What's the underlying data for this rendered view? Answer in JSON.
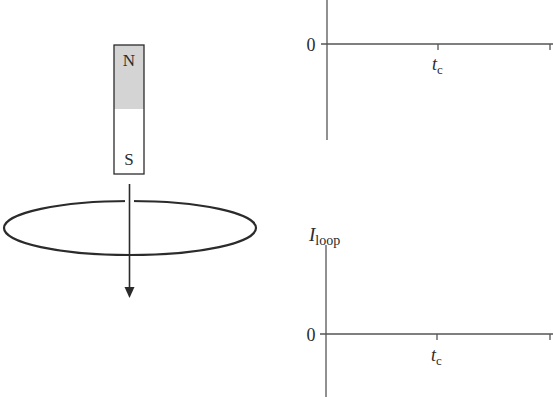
{
  "diagram": {
    "magnet": {
      "north_label": "N",
      "south_label": "S",
      "north_fill": "#d4d4d4",
      "south_fill": "#ffffff"
    },
    "motion_arrow": {
      "direction": "down"
    },
    "loop": {
      "shape": "ellipse"
    },
    "stroke_color": "#2b2b2b"
  },
  "graphs": [
    {
      "id": "top-graph",
      "y_label": "",
      "origin_label": "0",
      "x_tick_label": "t",
      "x_tick_subscript": "c"
    },
    {
      "id": "bottom-graph",
      "y_label_main": "I",
      "y_label_subscript": "loop",
      "origin_label": "0",
      "x_tick_label": "t",
      "x_tick_subscript": "c"
    }
  ]
}
